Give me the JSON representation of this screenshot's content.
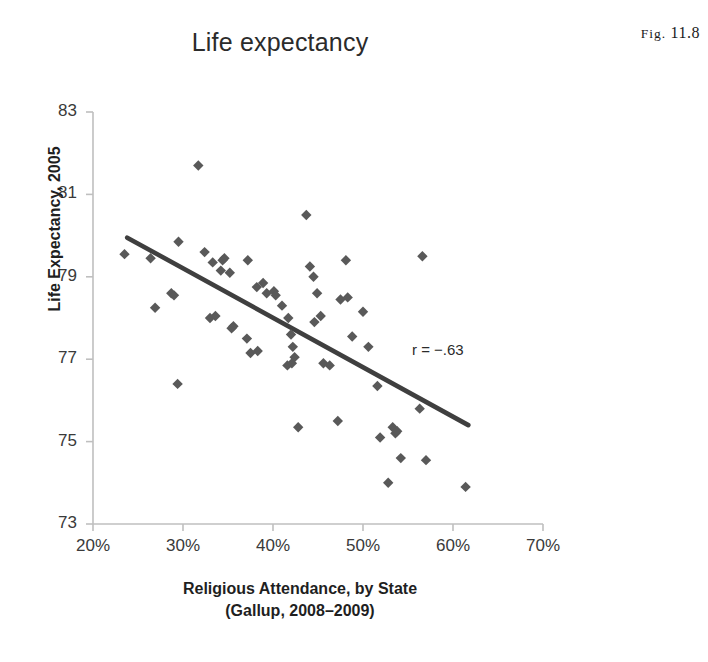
{
  "figure": {
    "caption_label": "Fig.",
    "caption_number": "11.8"
  },
  "chart_data": {
    "type": "scatter",
    "title": "Life expectancy",
    "xlabel": "Religious Attendance, by State",
    "xlabel_line2": "(Gallup, 2008–2009)",
    "ylabel": "Life Expectancy, 2005",
    "xlim": [
      20,
      70
    ],
    "ylim": [
      73,
      83
    ],
    "xtick_labels": [
      "20%",
      "30%",
      "40%",
      "50%",
      "60%",
      "70%"
    ],
    "xticks": [
      20,
      30,
      40,
      50,
      60,
      70
    ],
    "ytick_labels": [
      "83",
      "81",
      "79",
      "77",
      "75",
      "73"
    ],
    "yticks": [
      83,
      81,
      79,
      77,
      75,
      73
    ],
    "grid": false,
    "legend": "none",
    "annotation": "r = −.63",
    "correlation": -0.63,
    "marker": "diamond",
    "marker_color": "#595959",
    "trendline_color": "#3f3f3f",
    "axis_color": "#bfbfbf",
    "trendline": {
      "x0": 23.8,
      "y0": 79.95,
      "x1": 61.7,
      "y1": 75.4
    },
    "points": [
      [
        23.5,
        79.55
      ],
      [
        26.4,
        79.45
      ],
      [
        29.5,
        79.85
      ],
      [
        31.7,
        81.7
      ],
      [
        32.4,
        79.6
      ],
      [
        33.3,
        79.35
      ],
      [
        34.2,
        79.15
      ],
      [
        34.4,
        79.4
      ],
      [
        34.6,
        79.45
      ],
      [
        35.2,
        79.1
      ],
      [
        26.9,
        78.25
      ],
      [
        28.7,
        78.6
      ],
      [
        29.0,
        78.55
      ],
      [
        29.4,
        76.4
      ],
      [
        33.0,
        78.0
      ],
      [
        33.6,
        78.05
      ],
      [
        35.4,
        77.75
      ],
      [
        35.6,
        77.8
      ],
      [
        37.2,
        79.4
      ],
      [
        38.2,
        78.75
      ],
      [
        38.9,
        78.85
      ],
      [
        39.3,
        78.6
      ],
      [
        37.1,
        77.5
      ],
      [
        37.5,
        77.15
      ],
      [
        38.3,
        77.2
      ],
      [
        40.1,
        78.65
      ],
      [
        40.3,
        78.55
      ],
      [
        41.0,
        78.3
      ],
      [
        41.7,
        78.0
      ],
      [
        42.0,
        77.6
      ],
      [
        42.2,
        77.3
      ],
      [
        42.4,
        77.05
      ],
      [
        41.6,
        76.85
      ],
      [
        42.1,
        76.9
      ],
      [
        42.8,
        75.35
      ],
      [
        43.7,
        80.5
      ],
      [
        44.1,
        79.25
      ],
      [
        44.5,
        79.0
      ],
      [
        44.9,
        78.6
      ],
      [
        44.6,
        77.9
      ],
      [
        45.3,
        78.05
      ],
      [
        45.6,
        76.9
      ],
      [
        46.3,
        76.85
      ],
      [
        47.2,
        75.5
      ],
      [
        47.5,
        78.45
      ],
      [
        48.1,
        79.4
      ],
      [
        48.3,
        78.5
      ],
      [
        48.8,
        77.55
      ],
      [
        50.0,
        78.15
      ],
      [
        50.6,
        77.3
      ],
      [
        51.6,
        76.35
      ],
      [
        51.9,
        75.1
      ],
      [
        52.8,
        74.0
      ],
      [
        53.3,
        75.35
      ],
      [
        53.6,
        75.2
      ],
      [
        53.8,
        75.25
      ],
      [
        54.2,
        74.6
      ],
      [
        56.3,
        75.8
      ],
      [
        56.6,
        79.5
      ],
      [
        57.0,
        74.55
      ],
      [
        61.4,
        73.9
      ]
    ]
  }
}
